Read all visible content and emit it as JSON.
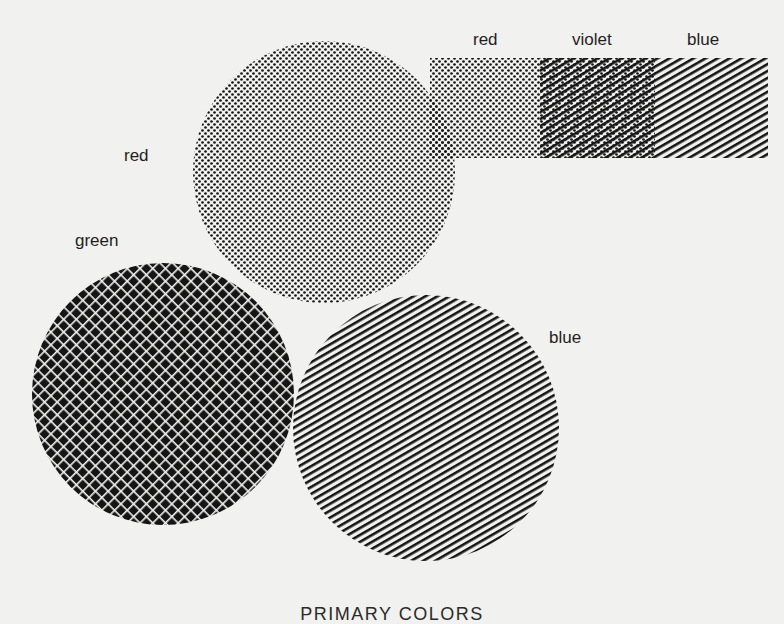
{
  "diagram": {
    "title": "PRIMARY COLORS",
    "background_color": "#f1f1ef",
    "ink_color": "#151515",
    "circles": [
      {
        "name": "red",
        "label": "red",
        "pattern": "dots",
        "cx": 324,
        "cy": 172,
        "r": 131,
        "label_x": 124,
        "label_y": 146
      },
      {
        "name": "green",
        "label": "green",
        "pattern": "crosshatch",
        "cx": 163,
        "cy": 394,
        "r": 131,
        "label_x": 75,
        "label_y": 231
      },
      {
        "name": "blue",
        "label": "blue",
        "pattern": "diagonal-lines",
        "cx": 426,
        "cy": 428,
        "r": 133,
        "label_x": 549,
        "label_y": 328
      }
    ],
    "mixing_bar": {
      "segments": [
        {
          "label": "red",
          "pattern": "dots",
          "x": 430,
          "width": 110
        },
        {
          "label": "violet",
          "pattern": "dots+diagonal-lines",
          "x": 540,
          "width": 115
        },
        {
          "label": "blue",
          "pattern": "diagonal-lines",
          "x": 655,
          "width": 113
        }
      ],
      "y": 58,
      "height": 100,
      "labels": [
        {
          "text": "red",
          "x": 473,
          "y": 30
        },
        {
          "text": "violet",
          "x": 572,
          "y": 30
        },
        {
          "text": "blue",
          "x": 687,
          "y": 30
        }
      ]
    }
  }
}
